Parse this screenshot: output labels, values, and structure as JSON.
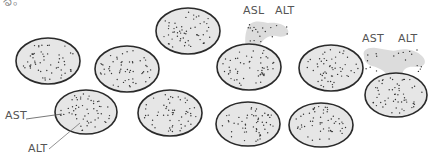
{
  "corner_text": "る。",
  "colors": {
    "cell_fill": "#e6e6e6",
    "cell_stroke": "#2a2a2a",
    "cloud_fill": "#dcdcdc",
    "dot": "#333333",
    "label": "#555555",
    "leader": "#555555"
  },
  "cells": [
    {
      "id": "cell-1",
      "cx": 48,
      "cy": 61,
      "rx": 32,
      "ry": 23,
      "leaking": false
    },
    {
      "id": "cell-2",
      "cx": 127,
      "cy": 69,
      "rx": 32,
      "ry": 23,
      "leaking": false
    },
    {
      "id": "cell-3",
      "cx": 188,
      "cy": 31,
      "rx": 32,
      "ry": 23,
      "leaking": false
    },
    {
      "id": "cell-4",
      "cx": 249,
      "cy": 67,
      "rx": 32,
      "ry": 23,
      "leaking": true
    },
    {
      "id": "cell-5",
      "cx": 331,
      "cy": 68,
      "rx": 32,
      "ry": 23,
      "leaking": false
    },
    {
      "id": "cell-6",
      "cx": 396,
      "cy": 95,
      "rx": 31,
      "ry": 22,
      "leaking": true
    },
    {
      "id": "cell-7",
      "cx": 86,
      "cy": 112,
      "rx": 31,
      "ry": 22,
      "leaking": false
    },
    {
      "id": "cell-8",
      "cx": 170,
      "cy": 113,
      "rx": 32,
      "ry": 23,
      "leaking": false
    },
    {
      "id": "cell-9",
      "cx": 248,
      "cy": 124,
      "rx": 32,
      "ry": 22,
      "leaking": false
    },
    {
      "id": "cell-10",
      "cx": 321,
      "cy": 125,
      "rx": 32,
      "ry": 22,
      "leaking": false
    }
  ],
  "labels": {
    "leak1_left": "ASL",
    "leak1_right": "ALT",
    "leak2_left": "AST",
    "leak2_right": "ALT",
    "inside_ast": "AST",
    "inside_alt": "ALT"
  }
}
